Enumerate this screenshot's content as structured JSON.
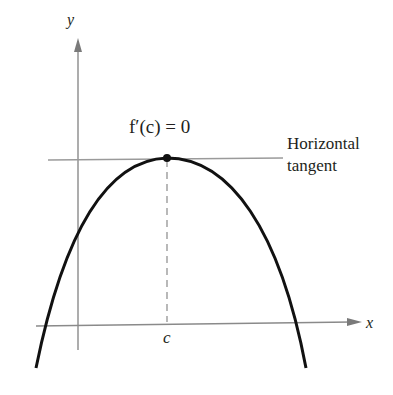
{
  "diagram": {
    "axes": {
      "x_label": "x",
      "y_label": "y"
    },
    "annotations": {
      "derivative_label": "f′(c) = 0",
      "tangent_label_line1": "Horizontal",
      "tangent_label_line2": "tangent",
      "c_label": "c"
    },
    "colors": {
      "curve": "#111111",
      "axes": "#8a8a8a",
      "tangent": "#9a9a9a",
      "dashed": "#8a8a8a",
      "text": "#231f20"
    }
  }
}
